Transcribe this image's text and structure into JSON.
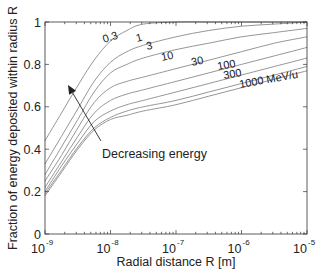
{
  "chart_data": {
    "type": "line",
    "title": "",
    "xlabel": "Radial distance R [m]",
    "ylabel": "Fraction of energy deposited within radius R",
    "xscale": "log",
    "xlim": [
      1e-09,
      1e-05
    ],
    "ylim": [
      0,
      1
    ],
    "grid": false,
    "x_ticks": [
      {
        "base": "10",
        "exp": "-9",
        "value": -9
      },
      {
        "base": "10",
        "exp": "-8",
        "value": -8
      },
      {
        "base": "10",
        "exp": "-7",
        "value": -7
      },
      {
        "base": "10",
        "exp": "-6",
        "value": -6
      },
      {
        "base": "10",
        "exp": "-5",
        "value": -5
      }
    ],
    "y_ticks": [
      {
        "label": "0",
        "value": 0
      },
      {
        "label": "0.2",
        "value": 0.2
      },
      {
        "label": "0.4",
        "value": 0.4
      },
      {
        "label": "0.6",
        "value": 0.6
      },
      {
        "label": "0.8",
        "value": 0.8
      },
      {
        "label": "1",
        "value": 1
      }
    ],
    "log10_x": [
      -9,
      -8.75,
      -8.5,
      -8.25,
      -8,
      -7.75,
      -7.5,
      -7,
      -6.5,
      -6,
      -5.5,
      -5
    ],
    "series": [
      {
        "name": "0.3",
        "label": "0.3",
        "values": [
          0.44,
          0.57,
          0.7,
          0.82,
          0.91,
          0.96,
          0.99,
          1.0,
          1.0,
          1.0,
          1.0,
          1.0
        ]
      },
      {
        "name": "1",
        "label": "1",
        "values": [
          0.33,
          0.46,
          0.59,
          0.72,
          0.81,
          0.86,
          0.89,
          0.93,
          0.96,
          0.98,
          0.99,
          1.0
        ]
      },
      {
        "name": "3",
        "label": "3",
        "values": [
          0.28,
          0.41,
          0.54,
          0.67,
          0.76,
          0.8,
          0.83,
          0.87,
          0.9,
          0.93,
          0.95,
          0.97
        ]
      },
      {
        "name": "10",
        "label": "10",
        "values": [
          0.25,
          0.37,
          0.5,
          0.62,
          0.69,
          0.72,
          0.74,
          0.78,
          0.82,
          0.86,
          0.9,
          0.93
        ]
      },
      {
        "name": "30",
        "label": "30",
        "values": [
          0.22,
          0.34,
          0.46,
          0.57,
          0.63,
          0.66,
          0.68,
          0.72,
          0.76,
          0.8,
          0.84,
          0.88
        ]
      },
      {
        "name": "100",
        "label": "100",
        "values": [
          0.2,
          0.32,
          0.43,
          0.53,
          0.58,
          0.61,
          0.63,
          0.67,
          0.71,
          0.75,
          0.79,
          0.83
        ]
      },
      {
        "name": "300",
        "label": "300",
        "values": [
          0.19,
          0.3,
          0.41,
          0.5,
          0.55,
          0.58,
          0.6,
          0.63,
          0.67,
          0.71,
          0.75,
          0.79
        ]
      },
      {
        "name": "1000",
        "label": "1000 MeV/u",
        "values": [
          0.18,
          0.29,
          0.4,
          0.49,
          0.54,
          0.56,
          0.58,
          0.61,
          0.65,
          0.69,
          0.73,
          0.77
        ]
      }
    ],
    "curve_labels": [
      {
        "text": "0.3",
        "x": 104,
        "y": 43,
        "rot": 18
      },
      {
        "text": "1",
        "x": 137,
        "y": 42,
        "rot": 15
      },
      {
        "text": "3",
        "x": 147,
        "y": 50,
        "rot": 12
      },
      {
        "text": "10",
        "x": 162,
        "y": 61,
        "rot": 12
      },
      {
        "text": "30",
        "x": 192,
        "y": 66,
        "rot": 12
      },
      {
        "text": "100",
        "x": 218,
        "y": 70,
        "rot": 10
      },
      {
        "text": "300",
        "x": 224,
        "y": 79,
        "rot": 10
      },
      {
        "text": "1000 MeV/u",
        "x": 240,
        "y": 88,
        "rot": 10
      }
    ],
    "annotations": [
      {
        "text": "Decreasing energy",
        "x": 102,
        "y": 158,
        "arrow_from": [
          101,
          141
        ],
        "arrow_to": [
          68,
          85
        ]
      }
    ],
    "legend": "inline curve labels"
  },
  "colors": {
    "axis": "#333333",
    "curves": "#8a8a8a",
    "arrow": "#222222"
  }
}
